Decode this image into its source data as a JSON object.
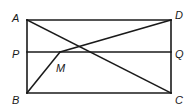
{
  "diagram": {
    "type": "geometry",
    "shape": "rectangle",
    "colors": {
      "stroke": "#1a1a1a",
      "background": "#ffffff"
    },
    "points": {
      "A": {
        "label": "A",
        "x": 27,
        "y": 20
      },
      "D": {
        "label": "D",
        "x": 171,
        "y": 20
      },
      "B": {
        "label": "B",
        "x": 27,
        "y": 93
      },
      "C": {
        "label": "C",
        "x": 171,
        "y": 93
      },
      "P": {
        "label": "P",
        "x": 27,
        "y": 52
      },
      "Q": {
        "label": "Q",
        "x": 171,
        "y": 52
      },
      "M": {
        "label": "M",
        "x": 60,
        "y": 52
      }
    },
    "segments": [
      [
        "A",
        "D"
      ],
      [
        "D",
        "C"
      ],
      [
        "C",
        "B"
      ],
      [
        "B",
        "A"
      ],
      [
        "P",
        "Q"
      ],
      [
        "A",
        "C"
      ],
      [
        "M",
        "D"
      ],
      [
        "M",
        "B"
      ]
    ]
  }
}
